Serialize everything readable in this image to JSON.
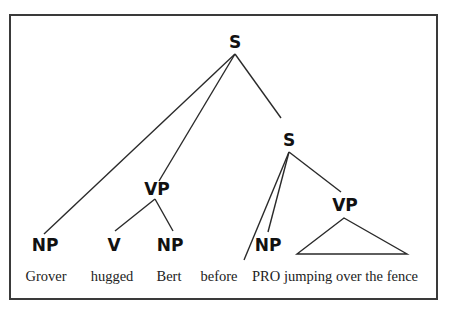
{
  "diagram": {
    "type": "syntax-tree",
    "nodes": {
      "root_s": "S",
      "vp_main": "VP",
      "s_adjunct": "S",
      "np_subject": "NP",
      "v": "V",
      "np_object": "NP",
      "np_pro": "NP",
      "vp_adjunct": "VP"
    },
    "words": {
      "grover": "Grover",
      "hugged": "hugged",
      "bert": "Bert",
      "before": "before",
      "pro": "PRO",
      "vp_phrase": "jumping over the fence"
    },
    "edges": [
      [
        "root_s",
        "np_subject"
      ],
      [
        "root_s",
        "vp_main"
      ],
      [
        "root_s",
        "s_adjunct"
      ],
      [
        "vp_main",
        "v"
      ],
      [
        "vp_main",
        "np_object"
      ],
      [
        "s_adjunct",
        "before"
      ],
      [
        "s_adjunct",
        "np_pro"
      ],
      [
        "s_adjunct",
        "vp_adjunct"
      ],
      [
        "vp_adjunct",
        "triangle"
      ]
    ],
    "colors": {
      "line": "#2a2a2a",
      "frame": "#3a3a3a",
      "text": "#111111"
    }
  }
}
